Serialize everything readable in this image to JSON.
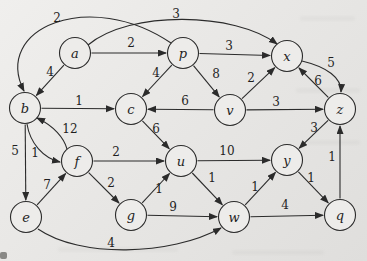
{
  "figure": {
    "ink_color": "#2b2b2b",
    "node_fill": "#edecea",
    "node_radius": 15.5,
    "label_color": "#1f1f1f",
    "canvas": {
      "width": 367,
      "height": 261
    },
    "nodes": [
      {
        "id": "a",
        "x": 75,
        "y": 53
      },
      {
        "id": "p",
        "x": 183,
        "y": 53
      },
      {
        "id": "x",
        "x": 287,
        "y": 56
      },
      {
        "id": "b",
        "x": 25,
        "y": 108
      },
      {
        "id": "c",
        "x": 131,
        "y": 109
      },
      {
        "id": "v",
        "x": 230,
        "y": 110
      },
      {
        "id": "z",
        "x": 340,
        "y": 109
      },
      {
        "id": "f",
        "x": 77,
        "y": 161
      },
      {
        "id": "u",
        "x": 181,
        "y": 161
      },
      {
        "id": "y",
        "x": 287,
        "y": 160
      },
      {
        "id": "e",
        "x": 26,
        "y": 217
      },
      {
        "id": "g",
        "x": 131,
        "y": 215
      },
      {
        "id": "w",
        "x": 234,
        "y": 217
      },
      {
        "id": "q",
        "x": 340,
        "y": 215
      }
    ],
    "edges": [
      {
        "from": "a",
        "to": "p",
        "weight": "2",
        "lx": 131,
        "ly": 43
      },
      {
        "from": "p",
        "to": "x",
        "weight": "3",
        "lx": 229,
        "ly": 46
      },
      {
        "from": "a",
        "to": "x",
        "weight": "3",
        "lx": 176,
        "ly": 14,
        "path": "M 88,45 C 130,10 235,12 277,44"
      },
      {
        "from": "p",
        "to": "b",
        "weight": "2",
        "lx": 57,
        "ly": 18,
        "path": "M 171,43 C 90,-12 -8,28 24,91"
      },
      {
        "from": "a",
        "to": "b",
        "weight": "4",
        "lx": 50,
        "ly": 72
      },
      {
        "from": "p",
        "to": "c",
        "weight": "4",
        "lx": 156,
        "ly": 73
      },
      {
        "from": "p",
        "to": "v",
        "weight": "8",
        "lx": 216,
        "ly": 74
      },
      {
        "from": "v",
        "to": "x",
        "weight": "2",
        "lx": 251,
        "ly": 78
      },
      {
        "from": "v",
        "to": "c",
        "weight": "6",
        "lx": 185,
        "ly": 101
      },
      {
        "from": "v",
        "to": "z",
        "weight": "3",
        "lx": 276,
        "ly": 102
      },
      {
        "from": "x",
        "to": "z",
        "weight": "5",
        "lx": 331,
        "ly": 63,
        "path": "M 302,61 C 327,67 342,78 341,92"
      },
      {
        "from": "z",
        "to": "x",
        "weight": "6",
        "lx": 318,
        "ly": 81
      },
      {
        "from": "b",
        "to": "c",
        "weight": "1",
        "lx": 79,
        "ly": 101
      },
      {
        "from": "b",
        "to": "e",
        "weight": "5",
        "lx": 15,
        "ly": 151
      },
      {
        "from": "b",
        "to": "f",
        "weight": "1",
        "lx": 35,
        "ly": 153,
        "path": "M 27,124 C 30,143 43,158 60,162"
      },
      {
        "from": "f",
        "to": "b",
        "weight": "12",
        "lx": 70,
        "ly": 129,
        "path": "M 67,149 C 64,138 54,126 37,118"
      },
      {
        "from": "e",
        "to": "f",
        "weight": "7",
        "lx": 47,
        "ly": 185
      },
      {
        "from": "f",
        "to": "u",
        "weight": "2",
        "lx": 116,
        "ly": 152
      },
      {
        "from": "f",
        "to": "g",
        "weight": "2",
        "lx": 111,
        "ly": 183
      },
      {
        "from": "c",
        "to": "u",
        "weight": "6",
        "lx": 156,
        "ly": 129
      },
      {
        "from": "g",
        "to": "u",
        "weight": "1",
        "lx": 159,
        "ly": 189
      },
      {
        "from": "g",
        "to": "w",
        "weight": "9",
        "lx": 173,
        "ly": 207
      },
      {
        "from": "u",
        "to": "y",
        "weight": "10",
        "lx": 227,
        "ly": 151
      },
      {
        "from": "u",
        "to": "w",
        "weight": "1",
        "lx": 212,
        "ly": 178
      },
      {
        "from": "w",
        "to": "y",
        "weight": "1",
        "lx": 255,
        "ly": 187
      },
      {
        "from": "w",
        "to": "q",
        "weight": "4",
        "lx": 285,
        "ly": 205
      },
      {
        "from": "y",
        "to": "q",
        "weight": "1",
        "lx": 311,
        "ly": 178
      },
      {
        "from": "z",
        "to": "y",
        "weight": "3",
        "lx": 314,
        "ly": 128
      },
      {
        "from": "q",
        "to": "z",
        "weight": "1",
        "lx": 332,
        "ly": 157
      },
      {
        "from": "e",
        "to": "w",
        "weight": "4",
        "lx": 111,
        "ly": 243,
        "path": "M 38,229 C 80,258 170,256 221,228"
      }
    ]
  }
}
